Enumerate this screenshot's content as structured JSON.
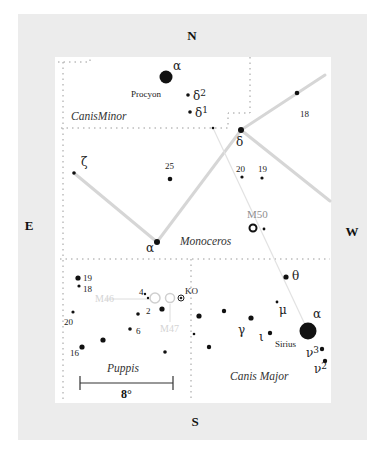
{
  "compass": {
    "north": "N",
    "south": "S",
    "east": "E",
    "west": "W"
  },
  "constellations": [
    {
      "name": "Canis Minor",
      "display": "CanisMinor",
      "x": 71,
      "y": 120
    },
    {
      "name": "Monoceros",
      "display": "Monoceros",
      "x": 180,
      "y": 245
    },
    {
      "name": "Puppis",
      "display": "Puppis",
      "x": 107,
      "y": 372
    },
    {
      "name": "Canis Major",
      "display": "Canis Major",
      "x": 230,
      "y": 380
    }
  ],
  "stars": [
    {
      "id": "cmi-alpha",
      "label": "α",
      "name": "Procyon",
      "x": 166,
      "y": 77,
      "r": 6.5,
      "lx": 173,
      "ly": 70,
      "nx": 131,
      "ny": 97
    },
    {
      "id": "cmi-delta2",
      "label": "δ2",
      "x": 188,
      "y": 95,
      "r": 1.8,
      "lx": 193,
      "ly": 100
    },
    {
      "id": "cmi-delta1",
      "label": "δ1",
      "x": 190,
      "y": 112,
      "r": 1.8,
      "lx": 195,
      "ly": 117
    },
    {
      "id": "cmi-minor",
      "label": "",
      "x": 213,
      "y": 128,
      "r": 1.3
    },
    {
      "id": "mon-delta",
      "label": "δ",
      "x": 241,
      "y": 130,
      "r": 3,
      "lx": 236,
      "ly": 146
    },
    {
      "id": "mon-18",
      "label": "18",
      "x": 297,
      "y": 93,
      "r": 2.3,
      "lx": 300,
      "ly": 117
    },
    {
      "id": "mon-zeta",
      "label": "ζ",
      "x": 74,
      "y": 173,
      "r": 1.8,
      "lx": 81,
      "ly": 166
    },
    {
      "id": "mon-25",
      "label": "25",
      "x": 170,
      "y": 179,
      "r": 2.3,
      "lx": 165,
      "ly": 169
    },
    {
      "id": "mon-20",
      "label": "20",
      "x": 242,
      "y": 177,
      "r": 1.6,
      "lx": 236,
      "ly": 172
    },
    {
      "id": "mon-19",
      "label": "19",
      "x": 262,
      "y": 178,
      "r": 1.6,
      "lx": 258,
      "ly": 172
    },
    {
      "id": "mon-alpha",
      "label": "α",
      "x": 157,
      "y": 242,
      "r": 3,
      "lx": 146,
      "ly": 252
    },
    {
      "id": "m50-star",
      "label": "",
      "x": 264,
      "y": 229,
      "r": 1.4
    },
    {
      "id": "pup-19",
      "label": "19",
      "x": 78,
      "y": 278,
      "r": 2.6,
      "lx": 83,
      "ly": 281
    },
    {
      "id": "pup-18",
      "label": "18",
      "x": 79,
      "y": 286,
      "r": 1.6,
      "lx": 83,
      "ly": 292
    },
    {
      "id": "pup-20",
      "label": "20",
      "x": 73,
      "y": 312,
      "r": 1.6,
      "lx": 64,
      "ly": 325
    },
    {
      "id": "pup-4a",
      "label": "4",
      "x": 145,
      "y": 294,
      "r": 1.2,
      "lx": 139,
      "ly": 295
    },
    {
      "id": "pup-4b",
      "label": "",
      "x": 148,
      "y": 298,
      "r": 1.2
    },
    {
      "id": "pup-2",
      "label": "2",
      "x": 138,
      "y": 314,
      "r": 1.8,
      "lx": 146,
      "ly": 314
    },
    {
      "id": "pup-ko-near",
      "label": "",
      "x": 162,
      "y": 309,
      "r": 2.6
    },
    {
      "id": "pup-6",
      "label": "6",
      "x": 130,
      "y": 329,
      "r": 1.8,
      "lx": 136,
      "ly": 334
    },
    {
      "id": "pup-a",
      "label": "",
      "x": 103,
      "y": 340,
      "r": 2.6
    },
    {
      "id": "pup-16",
      "label": "16",
      "x": 82,
      "y": 347,
      "r": 2.6,
      "lx": 70,
      "ly": 356
    },
    {
      "id": "pup-b",
      "label": "",
      "x": 165,
      "y": 352,
      "r": 1.8
    },
    {
      "id": "cma-a",
      "label": "",
      "x": 199,
      "y": 316,
      "r": 2.6
    },
    {
      "id": "cma-b",
      "label": "",
      "x": 194,
      "y": 334,
      "r": 1.3
    },
    {
      "id": "cma-c",
      "label": "",
      "x": 209,
      "y": 347,
      "r": 2.2
    },
    {
      "id": "cma-d",
      "label": "",
      "x": 224,
      "y": 311,
      "r": 2.2
    },
    {
      "id": "cma-gamma",
      "label": "γ",
      "x": 251,
      "y": 318,
      "r": 2.6,
      "lx": 238,
      "ly": 334
    },
    {
      "id": "cma-iota",
      "label": "ι",
      "x": 270,
      "y": 333,
      "r": 2.2,
      "lx": 259,
      "ly": 341
    },
    {
      "id": "cma-mu",
      "label": "μ",
      "x": 277,
      "y": 302,
      "r": 1.4,
      "lx": 279,
      "ly": 314
    },
    {
      "id": "cma-theta",
      "label": "θ",
      "x": 286,
      "y": 277,
      "r": 2.6,
      "lx": 292,
      "ly": 280
    },
    {
      "id": "cma-alpha",
      "label": "α",
      "x": 308,
      "y": 331,
      "r": 8.5,
      "lx": 313,
      "ly": 318,
      "name": "Sirius",
      "nx": 275,
      "ny": 347
    },
    {
      "id": "cma-nu3",
      "label": "ν3",
      "x": 322,
      "y": 349,
      "r": 2.2,
      "lx": 306,
      "ly": 357
    },
    {
      "id": "cma-nu2",
      "label": "ν2",
      "x": 325,
      "y": 361,
      "r": 2.2,
      "lx": 314,
      "ly": 373
    }
  ],
  "clusters": [
    {
      "id": "m50",
      "label": "M50",
      "x": 253,
      "y": 228,
      "r": 3.5,
      "lx": 247,
      "ly": 218,
      "style": "messier"
    },
    {
      "id": "ko",
      "label": "KO",
      "x": 181,
      "y": 298,
      "r": 3,
      "lx": 185,
      "ly": 294,
      "style": "ko"
    },
    {
      "id": "m46",
      "label": "M46",
      "x": 155,
      "y": 298,
      "r": 5,
      "lx": 95,
      "ly": 302,
      "style": "faint"
    },
    {
      "id": "m47",
      "label": "M47",
      "x": 170,
      "y": 298,
      "r": 4.5,
      "lx": 160,
      "ly": 332,
      "style": "faint"
    }
  ],
  "scale_bar": {
    "label": "8°",
    "x1": 80,
    "x2": 173,
    "y": 383
  }
}
